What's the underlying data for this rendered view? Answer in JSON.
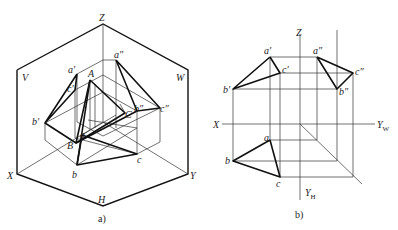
{
  "figure_a": {
    "caption": "a)",
    "axis_labels": {
      "z": "Z",
      "x": "X",
      "y": "Y",
      "h": "H",
      "v": "V",
      "w": "W"
    },
    "points": {
      "a_prime": "a′",
      "b_prime": "b′",
      "c_prime": "c′",
      "a_dprime": "a″",
      "b_dprime": "b″",
      "c_dprime": "c″",
      "A": "A",
      "B": "B",
      "C": "C",
      "a": "a",
      "b": "b",
      "c": "c"
    }
  },
  "figure_b": {
    "caption": "b)",
    "axis_labels": {
      "z": "Z",
      "x": "X",
      "yw": "Y",
      "yw_sub": "W",
      "yh": "Y",
      "yh_sub": "H"
    },
    "points": {
      "a_prime": "a′",
      "b_prime": "b′",
      "c_prime": "c′",
      "a_dprime": "a″",
      "b_dprime": "b″",
      "c_dprime": "c″",
      "a": "a",
      "b": "b",
      "c": "c"
    }
  }
}
